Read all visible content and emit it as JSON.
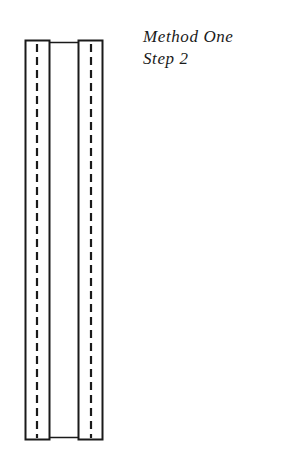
{
  "caption": {
    "line1": "Method One",
    "line2": "Step 2"
  },
  "diagram": {
    "stroke_color": "#1a1a1a",
    "background": "#ffffff",
    "left_strip": {
      "x": 25,
      "y": 40,
      "width": 24,
      "height": 400
    },
    "right_strip": {
      "x": 78,
      "y": 40,
      "width": 24,
      "height": 400
    },
    "connector_top_y": 42,
    "connector_bottom_y": 437,
    "dash_pattern": "8 5"
  }
}
